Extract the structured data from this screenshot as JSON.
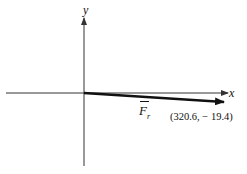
{
  "diagram": {
    "type": "vector-on-cartesian-axes",
    "axes": {
      "x_label": "x",
      "y_label": "y"
    },
    "vector": {
      "symbol": "F",
      "subscript": "r",
      "coordinates_label": "(320.6, − 19.4)",
      "components": {
        "x": 320.6,
        "y": -19.4
      }
    },
    "colors": {
      "axis": "#333333",
      "vector": "#111111",
      "background": "#ffffff"
    }
  }
}
